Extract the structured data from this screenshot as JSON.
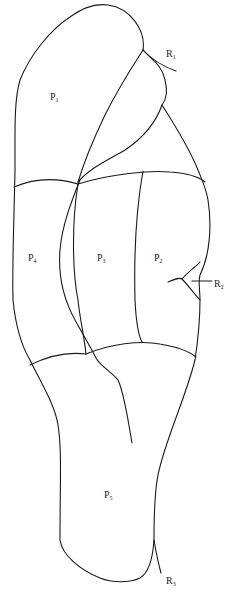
{
  "diagram": {
    "type": "anatomical-region-outline",
    "stroke_color": "#1a1a1a",
    "background": "#ffffff",
    "regions": [
      {
        "id": "P1",
        "base": "P",
        "sub": "1",
        "x": 50,
        "y": 92
      },
      {
        "id": "P2",
        "base": "P",
        "sub": "2",
        "x": 154,
        "y": 253
      },
      {
        "id": "P3",
        "base": "P",
        "sub": "3",
        "x": 97,
        "y": 253
      },
      {
        "id": "P4",
        "base": "P",
        "sub": "4",
        "x": 28,
        "y": 253
      },
      {
        "id": "P5",
        "base": "P",
        "sub": "5",
        "x": 104,
        "y": 490
      }
    ],
    "markers": [
      {
        "id": "R1",
        "base": "R",
        "sub": "1",
        "x": 166,
        "y": 49
      },
      {
        "id": "R2",
        "base": "R",
        "sub": "2",
        "x": 214,
        "y": 279
      },
      {
        "id": "R3",
        "base": "R",
        "sub": "3",
        "x": 166,
        "y": 576
      }
    ]
  }
}
